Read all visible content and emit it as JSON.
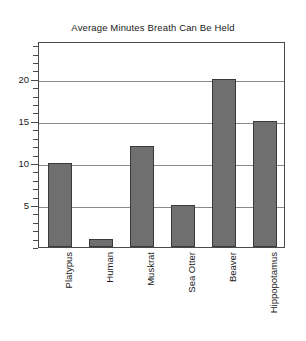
{
  "chart_data": {
    "type": "bar",
    "title": "Average Minutes Breath Can Be Held",
    "xlabel": "",
    "ylabel": "",
    "categories": [
      "Platypus",
      "Human",
      "Muskrat",
      "Sea Otter",
      "Beaver",
      "Hippopotamus"
    ],
    "values": [
      10,
      1,
      12,
      5,
      20,
      15
    ],
    "ylim": [
      0,
      24.5
    ],
    "ytick_labels": [
      "5",
      "10",
      "15",
      "20"
    ],
    "ytick_values": [
      5,
      10,
      15,
      20
    ],
    "minor_tick_interval": 1,
    "grid": "horizontal-at-major-ticks",
    "legend": "none",
    "bar_color": "#6f6f6f",
    "bar_edge_color": "#3a3a3a",
    "frame_color": "#4a4a4a",
    "grid_color": "#8a8a8a",
    "background": "#ffffff",
    "xtick_label_rotation": 90
  }
}
